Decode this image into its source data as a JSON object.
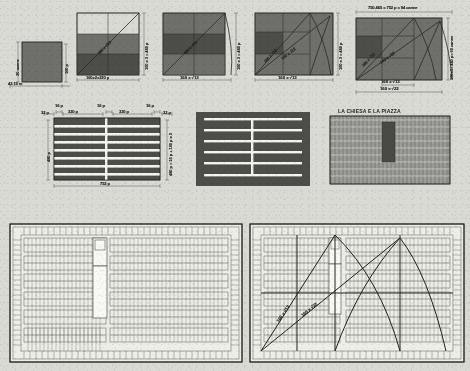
{
  "page": {
    "background_color": "#d8d8d3",
    "ink_color": "#2b2b27",
    "fill_dark": "#4e4e4b",
    "fill_mid": "#6f6f6c",
    "fill_light": "#f2f2ee"
  },
  "row1": {
    "fig1": {
      "name": "base-square-module",
      "labels": {
        "left_vertical": "20 canne",
        "right_vertical": "160 p",
        "bottom_left": "42.19 m"
      }
    },
    "fig2": {
      "name": "double-square-diagonal",
      "labels": {
        "bottom": "160x2=320 p",
        "right_vertical": "160 x 3 = 480 p",
        "diagonal": "160 x √13"
      }
    },
    "fig3": {
      "name": "arc-rotation-root13",
      "labels": {
        "bottom": "160 x √13",
        "right_vertical": "160 x 3 = 480 p",
        "diagonal": "160 x √13"
      }
    },
    "fig4": {
      "name": "arc-rotation-root22-intersect",
      "labels": {
        "bottom": "160 x √13",
        "right_vertical": "160 x 3 = 480 p",
        "diagonal_a": "160 x √13",
        "diagonal_b": "160 x √22"
      }
    },
    "fig5": {
      "name": "final-rectangle-proportions",
      "labels": {
        "top": "750.465 = 752 p = 94 canne",
        "bottom_inner": "160 x √13",
        "bottom_outer": "160 x √22",
        "right_vertical": "160x3= 480 p= 60 canne",
        "diagonal_a": "160 x √13",
        "diagonal_b": "160 x √22"
      }
    }
  },
  "row2": {
    "fig6": {
      "name": "block-subdivision-dimensioned",
      "labels": {
        "top_1": "16 p",
        "top_2": "320 p",
        "top_3": "16 p",
        "top_4": "320 p",
        "top_5": "16 p",
        "left_corner": "32 p",
        "right_corner": "32 p",
        "left_vertical": "480 p",
        "bottom": "752 p",
        "right_v1": "160 p",
        "right_v2": "16 p",
        "right_v3": "160 p",
        "right_v4": "16 p",
        "right_v5": "160 p",
        "right_stack": "480 p = 16 p + 160 p x 3"
      }
    },
    "fig7": {
      "name": "block-subdivision-plain",
      "labels": {}
    },
    "fig8": {
      "name": "church-and-piazza-plan-small",
      "labels": {
        "title": "LA CHIESA E LA PIAZZA"
      }
    }
  },
  "row3": {
    "fig9": {
      "name": "city-plan-full",
      "labels": {}
    },
    "fig10": {
      "name": "city-plan-with-geometric-overlay",
      "labels": {
        "diagonal_a": "160 x √13",
        "diagonal_b": "160 x √22"
      }
    }
  }
}
